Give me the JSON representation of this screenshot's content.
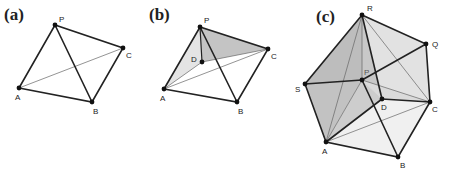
{
  "panels": [
    {
      "id": "a",
      "label": "(a)",
      "vertices": {
        "P": "P",
        "A": "A",
        "B": "B",
        "C": "C"
      },
      "description": "Tetrahedron P-ABC with hidden edge AC"
    },
    {
      "id": "b",
      "label": "(b)",
      "vertices": {
        "P": "P",
        "A": "A",
        "B": "B",
        "C": "C",
        "D": "D"
      },
      "description": "Pyramid with interior point D; faces PAD and PDC shaded"
    },
    {
      "id": "c",
      "label": "(c)",
      "vertices": {
        "R": "R",
        "Q": "Q",
        "S": "S",
        "P": "P",
        "D": "D",
        "A": "A",
        "B": "B",
        "C": "C"
      },
      "description": "Composite polyhedral subdivision with vertices R, Q, S, P, D, A, B, C"
    }
  ],
  "colors": {
    "edge": "#222222",
    "hidden_edge": "#666666",
    "shade_dark": "#bdbdbd",
    "shade_mid": "#d6d6d6",
    "shade_light": "#ececec"
  }
}
